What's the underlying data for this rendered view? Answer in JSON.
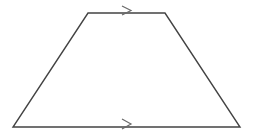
{
  "figure": {
    "shape_name": "trapezoid",
    "background_color": "#ffffff",
    "stroke_color": "#434343",
    "stroke_width": 1.4,
    "marker_stroke_color": "#6a6a6a",
    "marker_stroke_width": 1.2,
    "canvas": {
      "width": 253,
      "height": 138
    },
    "vertices": [
      {
        "name": "top-left",
        "x": 88,
        "y": 13
      },
      {
        "name": "top-right",
        "x": 165,
        "y": 13
      },
      {
        "name": "bottom-right",
        "x": 240,
        "y": 127
      },
      {
        "name": "bottom-left",
        "x": 13,
        "y": 127
      }
    ],
    "polygon_points": "88,13 165,13 240,127 13,127",
    "edges": [
      {
        "name": "top-base",
        "from": "top-left",
        "to": "top-right",
        "parallel_marks": 1
      },
      {
        "name": "right-leg",
        "from": "top-right",
        "to": "bottom-right",
        "parallel_marks": 0
      },
      {
        "name": "bottom-base",
        "from": "bottom-right",
        "to": "bottom-left",
        "parallel_marks": 1
      },
      {
        "name": "left-leg",
        "from": "bottom-left",
        "to": "top-left",
        "parallel_marks": 0
      }
    ],
    "markers": [
      {
        "name": "top-parallel-arrow",
        "glyph": "chevron-right-icon",
        "on_edge": "top-base",
        "center_x": 127,
        "center_y": 10,
        "path": "M 122,6 L 131,10.5 L 122,15"
      },
      {
        "name": "bottom-parallel-arrow",
        "glyph": "chevron-right-icon",
        "on_edge": "bottom-base",
        "center_x": 127,
        "center_y": 124,
        "path": "M 122,119 L 131,124 L 122,129"
      }
    ]
  }
}
